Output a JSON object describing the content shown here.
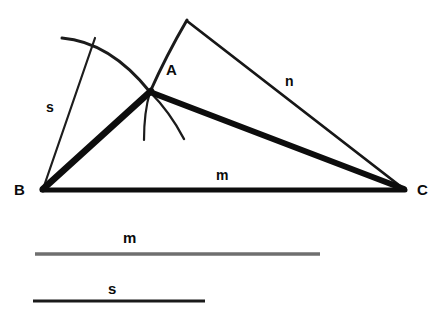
{
  "figure": {
    "background_color": "#ffffff",
    "ink_color": "#111111",
    "secondary_ink_color": "#5b5b5b",
    "width": 441,
    "height": 316
  },
  "vertices": [
    {
      "name": "B",
      "label": "B",
      "x": 42,
      "y": 190,
      "label_x": 14,
      "label_y": 182
    },
    {
      "name": "A",
      "label": "A",
      "x": 150,
      "y": 92,
      "label_x": 166,
      "label_y": 62
    },
    {
      "name": "C",
      "label": "C",
      "x": 405,
      "y": 190,
      "label_x": 417,
      "label_y": 182
    }
  ],
  "side_labels": [
    {
      "name": "m",
      "label": "m",
      "x": 216,
      "y": 168,
      "describes": "base-segment-BC"
    },
    {
      "name": "n",
      "label": "n",
      "x": 285,
      "y": 74,
      "describes": "segment-apex-to-C"
    },
    {
      "name": "s",
      "label": "s",
      "x": 46,
      "y": 100,
      "describes": "segment-from-B"
    }
  ],
  "reference_segments": [
    {
      "name": "m",
      "label": "m",
      "label_x": 123,
      "label_y": 230,
      "x1": 35,
      "x2": 320,
      "y": 254,
      "thickness": 3,
      "color": "#6f6f6f"
    },
    {
      "name": "s",
      "label": "s",
      "label_x": 108,
      "label_y": 281,
      "x1": 33,
      "x2": 205,
      "y": 301,
      "thickness": 3,
      "color": "#1a1a1a"
    }
  ],
  "strokes": {
    "base_BC": {
      "name": "base-BC",
      "width": 5
    },
    "side_BA": {
      "name": "side-BA",
      "width": 6
    },
    "side_AC": {
      "name": "side-AC",
      "width": 6
    },
    "segment_n": {
      "name": "segment-n",
      "width": 2.6
    },
    "segment_s": {
      "name": "segment-s",
      "width": 2.2
    },
    "arc_left": {
      "name": "arc-left",
      "width": 3
    },
    "arc_right": {
      "name": "arc-right",
      "width": 3
    },
    "tick_down": {
      "name": "tick-down",
      "width": 2.2
    },
    "tick_diag": {
      "name": "tick-diagonal",
      "width": 2.4
    }
  },
  "apex": {
    "name": "apex-point",
    "x": 187,
    "y": 20
  }
}
